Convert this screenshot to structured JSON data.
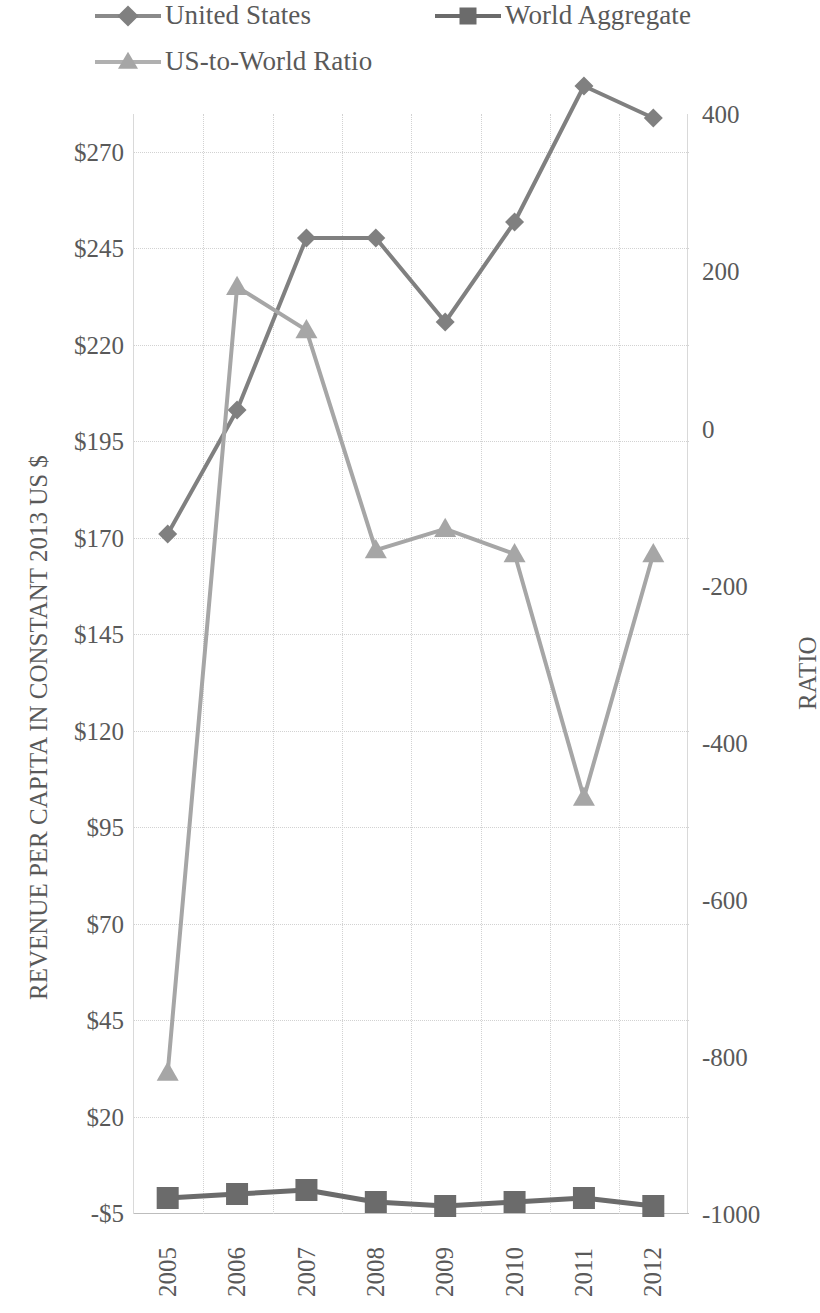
{
  "legend": {
    "items": [
      {
        "label": "United States",
        "marker": "diamond",
        "color": "#808080",
        "name": "legend-item-united-states"
      },
      {
        "label": "World Aggregate",
        "marker": "square",
        "color": "#6b6b6b",
        "name": "legend-item-world-aggregate"
      },
      {
        "label": "US-to-World Ratio",
        "marker": "triangle",
        "color": "#a6a6a6",
        "name": "legend-item-us-to-world-ratio"
      }
    ]
  },
  "axes": {
    "left_title": "REVENUE PER CAPITA IN CONSTANT 2013 US $",
    "right_title": "RATIO",
    "left_ticks": [
      "$270",
      "$245",
      "$220",
      "$195",
      "$170",
      "$145",
      "$120",
      "$95",
      "$70",
      "$45",
      "$20",
      "-$5"
    ],
    "right_ticks": [
      "400",
      "200",
      "0",
      "-200",
      "-400",
      "-600",
      "-800",
      "-1000"
    ],
    "x_ticks": [
      "2005",
      "2006",
      "2007",
      "2008",
      "2009",
      "2010",
      "2011",
      "2012"
    ]
  },
  "chart_data": {
    "type": "line",
    "title": "",
    "xlabel": "",
    "ylabel": "REVENUE PER CAPITA IN CONSTANT 2013 US $",
    "y2label": "RATIO",
    "categories": [
      "2005",
      "2006",
      "2007",
      "2008",
      "2009",
      "2010",
      "2011",
      "2012"
    ],
    "ylim": [
      -5,
      270
    ],
    "y2lim": [
      -1000,
      400
    ],
    "grid": true,
    "legend_position": "top",
    "series": [
      {
        "name": "United States",
        "axis": "left",
        "marker": "diamond",
        "color": "#808080",
        "values": [
          165,
          196,
          239,
          239,
          218,
          243,
          277,
          269
        ]
      },
      {
        "name": "World Aggregate",
        "axis": "left",
        "marker": "square",
        "color": "#6b6b6b",
        "values": [
          -1,
          0,
          1,
          -2,
          -3,
          -2,
          -1,
          -3
        ]
      },
      {
        "name": "US-to-World Ratio",
        "axis": "right",
        "marker": "triangle",
        "color": "#a6a6a6",
        "values": [
          -820,
          180,
          125,
          -155,
          -128,
          -160,
          -470,
          -160
        ]
      }
    ]
  }
}
